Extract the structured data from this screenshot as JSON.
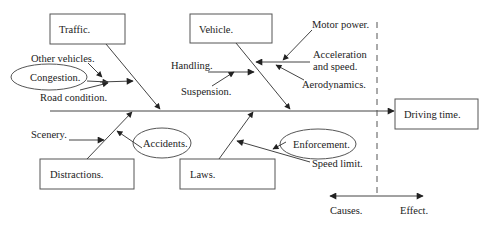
{
  "diagram": {
    "type": "fishbone (cause-and-effect)",
    "effect": {
      "label": "Driving time."
    },
    "categories": {
      "traffic": {
        "label": "Traffic.",
        "causes": [
          "Other vehicles.",
          "Congestion.",
          "Road condition."
        ]
      },
      "vehicle": {
        "label": "Vehicle.",
        "causes": [
          "Handling.",
          "Suspension.",
          "Motor power.",
          "Acceleration",
          "and speed.",
          "Aerodynamics."
        ]
      },
      "distractions": {
        "label": "Distractions.",
        "causes": [
          "Scenery.",
          "Accidents."
        ]
      },
      "laws": {
        "label": "Laws.",
        "causes": [
          "Enforcement.",
          "Speed limit."
        ]
      }
    },
    "legend": {
      "causes_label": "Causes.",
      "effect_label": "Effect."
    },
    "colors": {
      "line": "#444444",
      "text": "#222222",
      "background": "#ffffff"
    }
  }
}
